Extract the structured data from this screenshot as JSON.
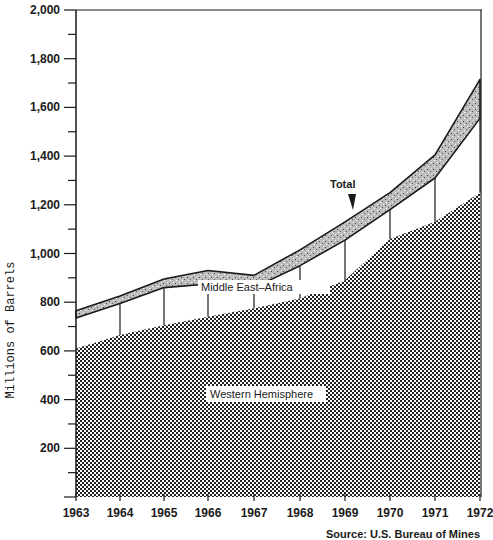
{
  "chart_data": {
    "type": "area",
    "title": "",
    "xlabel": "",
    "ylabel": "Millions of Barrels",
    "ylim": [
      0,
      2000
    ],
    "yticks": [
      200,
      400,
      600,
      800,
      1000,
      1200,
      1400,
      1600,
      1800,
      2000
    ],
    "ytick_labels": [
      "200",
      "400",
      "600",
      "800",
      "1,000",
      "1,200",
      "1,400",
      "1,600",
      "1,800",
      "2,000"
    ],
    "categories": [
      "1963",
      "1964",
      "1965",
      "1966",
      "1967",
      "1968",
      "1969",
      "1970",
      "1971",
      "1972"
    ],
    "stacked": true,
    "grid": false,
    "series": [
      {
        "name": "Western Hemisphere",
        "values": [
          610,
          665,
          705,
          740,
          775,
          815,
          890,
          1060,
          1130,
          1250
        ]
      },
      {
        "name": "Middle East–Africa",
        "values": [
          125,
          130,
          155,
          135,
          85,
          135,
          165,
          120,
          180,
          305
        ]
      },
      {
        "name": "Other",
        "values": [
          30,
          30,
          35,
          55,
          50,
          65,
          75,
          70,
          95,
          160
        ]
      }
    ],
    "cumulative_tops": {
      "western_hemisphere": [
        610,
        665,
        705,
        740,
        775,
        815,
        890,
        1060,
        1130,
        1250
      ],
      "middle_east_africa": [
        735,
        795,
        860,
        875,
        860,
        950,
        1055,
        1180,
        1310,
        1555
      ],
      "total": [
        765,
        825,
        895,
        930,
        910,
        1015,
        1130,
        1250,
        1405,
        1715
      ]
    },
    "annotations": [
      "Total",
      "Other",
      "Middle East–Africa",
      "Western Hemisphere"
    ]
  },
  "labels": {
    "ylabel": "Millions   of   Barrels",
    "total": "Total",
    "other": "Other",
    "middle_east_africa": "Middle East–Africa",
    "western_hemisphere": "Western Hemisphere",
    "source": "Source: U.S. Bureau of Mines"
  },
  "colors": {
    "ink": "#1a1a1a",
    "background": "#ffffff"
  }
}
